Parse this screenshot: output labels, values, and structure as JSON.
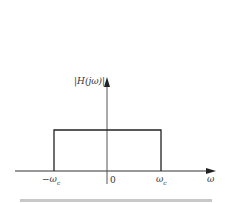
{
  "diagram": {
    "type": "ideal-lowpass-filter-magnitude-response",
    "y_axis_label": "|H(jω)|",
    "x_axis_label": "ω",
    "tick_labels": {
      "neg_cutoff": "−ω",
      "neg_cutoff_sub": "c",
      "origin": "0",
      "pos_cutoff": "ω",
      "pos_cutoff_sub": "c"
    },
    "colors": {
      "line": "#222222",
      "separator": "#c8c8c8"
    }
  }
}
